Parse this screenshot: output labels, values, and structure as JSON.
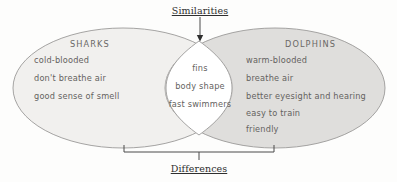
{
  "diagram": {
    "type": "venn",
    "title_top": "Similarities",
    "title_bottom": "Differences",
    "colors": {
      "left_fill": "#f1f0ee",
      "right_fill": "#dedddb",
      "overlap_fill": "#cfcecc",
      "intersection_fill": "#ffffff",
      "outline": "#9b9a98",
      "connector": "#4a4a4a",
      "hand_text": "#646260",
      "label_text": "#2f2f2f"
    },
    "left_set": {
      "title": "SHARKS",
      "items": [
        "cold-blooded",
        "don't breathe air",
        "good sense of smell"
      ]
    },
    "right_set": {
      "title": "DOLPHINS",
      "items": [
        "warm-blooded",
        "breathe air",
        "better eyesight and hearing",
        "easy to train",
        "friendly"
      ]
    },
    "intersection": {
      "items": [
        "fins",
        "body shape",
        "fast swimmers"
      ]
    }
  }
}
